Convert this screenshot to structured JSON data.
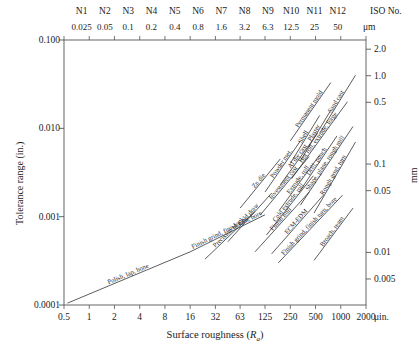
{
  "chart_data": {
    "type": "line",
    "title": "",
    "xlabel": "Surface roughness (Ra)",
    "ylabel": "Tolerance range (in.)",
    "y2label": "mm",
    "x_unit": "μin.",
    "y2_unit": "mm",
    "grid": false,
    "legend": "none",
    "xscale": "log",
    "yscale": "log",
    "xlim": [
      0.5,
      2000
    ],
    "ylim": [
      0.0001,
      0.1
    ],
    "xticks": [
      "0.5",
      "1",
      "2",
      "4",
      "8",
      "16",
      "32",
      "63",
      "125",
      "250",
      "500",
      "1000",
      "2000"
    ],
    "yticks": [
      "0.100",
      "0.010",
      "0.001",
      "0.0001"
    ],
    "y2ticks": [
      "2.0",
      "1.0",
      "0.5",
      "0.1",
      "0.05",
      "0.01",
      "0.005"
    ],
    "top_axis": {
      "tag": "ISO No.",
      "unit": "μm",
      "grades": [
        "N1",
        "N2",
        "N3",
        "N4",
        "N5",
        "N6",
        "N7",
        "N8",
        "N9",
        "N10",
        "N11",
        "N12"
      ],
      "values": [
        "0.025",
        "0.05",
        "0.1",
        "0.2",
        "0.4",
        "0.8",
        "1.6",
        "3.2",
        "6.3",
        "12.5",
        "25",
        "50"
      ]
    },
    "processes": [
      {
        "label": "Permanent mold",
        "x0": 250,
        "y0": 0.0072,
        "x1": 760,
        "y1": 0.033
      },
      {
        "label": "Shell",
        "x0": 250,
        "y0": 0.004,
        "x1": 560,
        "y1": 0.014
      },
      {
        "label": "Sand cast",
        "x0": 560,
        "y0": 0.0088,
        "x1": 1500,
        "y1": 0.04
      },
      {
        "label": "Powder met.",
        "x0": 125,
        "y0": 0.0019,
        "x1": 330,
        "y1": 0.0072
      },
      {
        "label": "Plaster",
        "x0": 330,
        "y0": 0.0043,
        "x1": 760,
        "y1": 0.016
      },
      {
        "label": "Zn die",
        "x0": 63,
        "y0": 0.00125,
        "x1": 190,
        "y1": 0.0045
      },
      {
        "label": "Al die cast",
        "x0": 190,
        "y0": 0.0023,
        "x1": 530,
        "y1": 0.0088
      },
      {
        "label": "Hot roll, extrude, forge",
        "x0": 260,
        "y0": 0.0027,
        "x1": 1200,
        "y1": 0.02
      },
      {
        "label": "Investment cast",
        "x0": 110,
        "y0": 0.00105,
        "x1": 420,
        "y1": 0.0048
      },
      {
        "label": "Extrude, roll",
        "x0": 185,
        "y0": 0.00118,
        "x1": 560,
        "y1": 0.005
      },
      {
        "label": "Drill, punch",
        "x0": 320,
        "y0": 0.0019,
        "x1": 900,
        "y1": 0.0082
      },
      {
        "label": "Shape, plane, rough mill",
        "x0": 330,
        "y0": 0.00135,
        "x1": 1400,
        "y1": 0.0105
      },
      {
        "label": "Rough grnd, turn",
        "x0": 480,
        "y0": 0.0011,
        "x1": 1500,
        "y1": 0.007
      },
      {
        "label": "Cold draw",
        "x0": 45,
        "y0": 0.00052,
        "x1": 150,
        "y1": 0.00185
      },
      {
        "label": "Cold extrude, roll",
        "x0": 130,
        "y0": 0.00062,
        "x1": 470,
        "y1": 0.0029
      },
      {
        "label": "Precision blank",
        "x0": 24,
        "y0": 0.00033,
        "x1": 95,
        "y1": 0.00115
      },
      {
        "label": "Finish mill",
        "x0": 95,
        "y0": 0.0004,
        "x1": 420,
        "y1": 0.0019
      },
      {
        "label": "ECM-EDM",
        "x0": 150,
        "y0": 0.00038,
        "x1": 620,
        "y1": 0.00175
      },
      {
        "label": "Finish grind, finish turn, bore",
        "x0": 180,
        "y0": 0.0003,
        "x1": 1050,
        "y1": 0.00175
      },
      {
        "label": "Broach, ream",
        "x0": 480,
        "y0": 0.00032,
        "x1": 1400,
        "y1": 0.00125
      },
      {
        "label": "Polish, lap, hone",
        "x0": 0.55,
        "y0": 0.000105,
        "x1": 16,
        "y1": 0.0004
      },
      {
        "label": "Finish grind, finish turn, bore",
        "x0": 16,
        "y0": 0.0004,
        "x1": 125,
        "y1": 0.00105
      }
    ]
  }
}
